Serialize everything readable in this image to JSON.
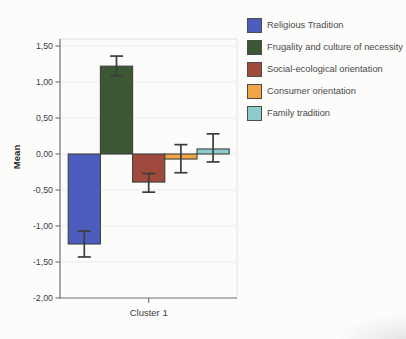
{
  "chart_data": {
    "type": "bar",
    "title": "",
    "xlabel": "",
    "ylabel": "Mean",
    "categories": [
      "Cluster 1"
    ],
    "ylim": [
      -2.0,
      1.6
    ],
    "grid": true,
    "legend_position": "top-right",
    "decimal_style": "comma",
    "y_ticks": [
      {
        "label": "1,50",
        "value": 1.5
      },
      {
        "label": "1,00",
        "value": 1.0
      },
      {
        "label": "0,50",
        "value": 0.5
      },
      {
        "label": "0,00",
        "value": 0.0
      },
      {
        "label": "-0,50",
        "value": -0.5
      },
      {
        "label": "-1,00",
        "value": -1.0
      },
      {
        "label": "-1,50",
        "value": -1.5
      },
      {
        "label": "-2,00",
        "value": -2.0
      }
    ],
    "series": [
      {
        "name": "Religious Tradition",
        "mean": -1.25,
        "ci_low": -1.43,
        "ci_high": -1.07,
        "color": "#4d5dbd"
      },
      {
        "name": "Frugality and culture of necessity",
        "mean": 1.22,
        "ci_low": 1.09,
        "ci_high": 1.36,
        "color": "#3b5733"
      },
      {
        "name": "Social-ecological orientation",
        "mean": -0.39,
        "ci_low": -0.53,
        "ci_high": -0.27,
        "color": "#a04a3e"
      },
      {
        "name": "Consumer orientation",
        "mean": -0.07,
        "ci_low": -0.26,
        "ci_high": 0.13,
        "color": "#f2a445"
      },
      {
        "name": "Family tradition",
        "mean": 0.07,
        "ci_low": -0.11,
        "ci_high": 0.28,
        "color": "#8ccccb"
      }
    ]
  },
  "colors": {
    "background": "#fcfcfb",
    "bar_border": "#3f3f3f",
    "error_bar": "#3d3d3d",
    "axis": "#717171",
    "grid": "#ececec",
    "plot_border": "#e3e3e3",
    "tick_text": "#3e3e3e",
    "legend_text": "#4a4a4a"
  }
}
